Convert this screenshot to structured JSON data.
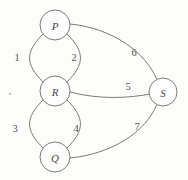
{
  "figure": {
    "kind": "undirected-multigraph-diagram",
    "background_color": "#fdfdfc",
    "stroke_color": "#6e6b68",
    "label_color": "#56524f",
    "width": 188,
    "height": 180
  },
  "nodes": [
    {
      "id": "P",
      "label": "P",
      "cx": 55,
      "cy": 25,
      "r": 15
    },
    {
      "id": "R",
      "label": "R",
      "cx": 55,
      "cy": 91,
      "r": 15
    },
    {
      "id": "Q",
      "label": "Q",
      "cx": 55,
      "cy": 157,
      "r": 15
    },
    {
      "id": "S",
      "label": "S",
      "cx": 163,
      "cy": 92,
      "r": 14
    }
  ],
  "edges": [
    {
      "id": "e1",
      "label": "1",
      "from": "P",
      "to": "R",
      "side": "left",
      "label_x": 17,
      "label_y": 57
    },
    {
      "id": "e2",
      "label": "2",
      "from": "P",
      "to": "R",
      "side": "right",
      "label_x": 74,
      "label_y": 57
    },
    {
      "id": "e3",
      "label": "3",
      "from": "R",
      "to": "Q",
      "side": "left",
      "label_x": 15,
      "label_y": 128
    },
    {
      "id": "e4",
      "label": "4",
      "from": "R",
      "to": "Q",
      "side": "right",
      "label_x": 76,
      "label_y": 128
    },
    {
      "id": "e5",
      "label": "5",
      "from": "R",
      "to": "S",
      "side": "center",
      "label_x": 128,
      "label_y": 86
    },
    {
      "id": "e6",
      "label": "6",
      "from": "P",
      "to": "S",
      "side": "upper",
      "label_x": 134,
      "label_y": 52
    },
    {
      "id": "e7",
      "label": "7",
      "from": "Q",
      "to": "S",
      "side": "lower",
      "label_x": 137,
      "label_y": 126
    }
  ],
  "artifacts": [
    {
      "id": "speck",
      "x": 10,
      "y": 94,
      "r": 1.1
    }
  ]
}
